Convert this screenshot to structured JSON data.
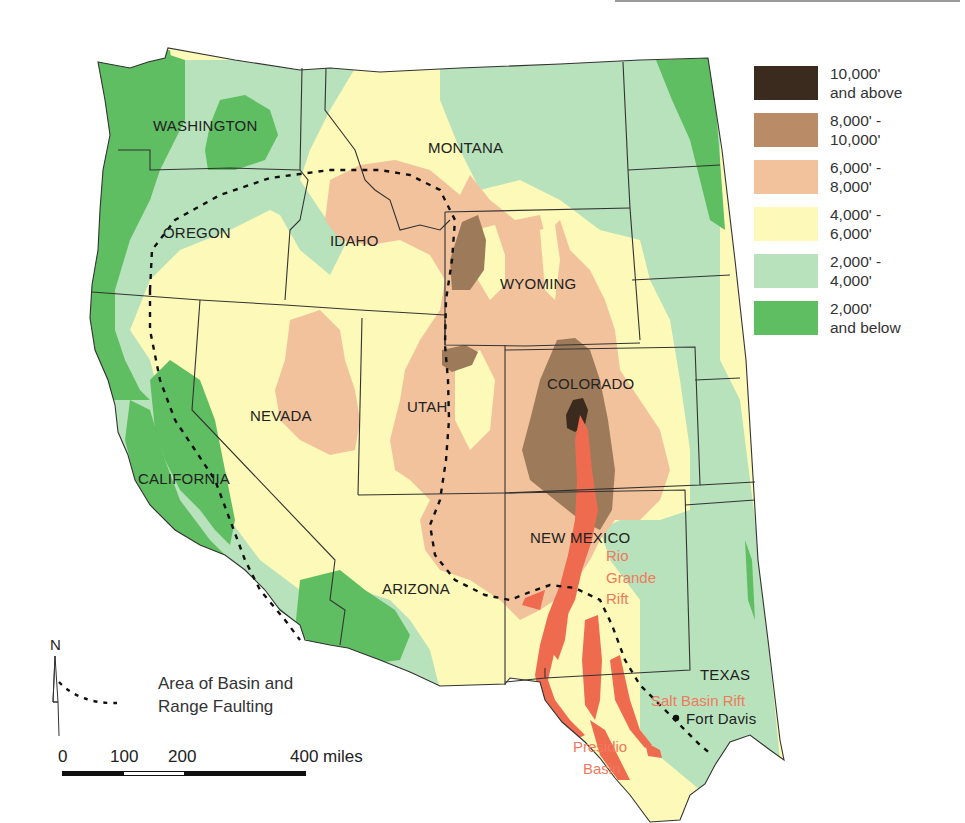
{
  "map": {
    "title": "",
    "states": [
      {
        "name": "WASHINGTON",
        "x": 153,
        "y": 131
      },
      {
        "name": "OREGON",
        "x": 163,
        "y": 238
      },
      {
        "name": "IDAHO",
        "x": 330,
        "y": 246
      },
      {
        "name": "MONTANA",
        "x": 428,
        "y": 153
      },
      {
        "name": "WYOMING",
        "x": 500,
        "y": 289
      },
      {
        "name": "NEVADA",
        "x": 250,
        "y": 421
      },
      {
        "name": "UTAH",
        "x": 407,
        "y": 412
      },
      {
        "name": "COLORADO",
        "x": 547,
        "y": 389
      },
      {
        "name": "CALIFORNIA",
        "x": 138,
        "y": 484
      },
      {
        "name": "ARIZONA",
        "x": 382,
        "y": 594
      },
      {
        "name": "NEW MEXICO",
        "x": 530,
        "y": 543
      },
      {
        "name": "TEXAS",
        "x": 700,
        "y": 680
      }
    ],
    "features": [
      {
        "name": "Rio",
        "x": 606,
        "y": 561
      },
      {
        "name": "Grande",
        "x": 606,
        "y": 583
      },
      {
        "name": "Rift",
        "x": 606,
        "y": 604
      },
      {
        "name": "Salt Basin Rift",
        "x": 651,
        "y": 706
      },
      {
        "name": "Presidio",
        "x": 573,
        "y": 752
      },
      {
        "name": "Basin",
        "x": 583,
        "y": 774
      }
    ],
    "places": [
      {
        "name": "Fort Davis",
        "x": 686,
        "y": 724
      }
    ]
  },
  "legend": {
    "elevation_classes": [
      {
        "line1": "10,000'",
        "line2": "and above",
        "color": "#3b2a1e"
      },
      {
        "line1": "8,000' -",
        "line2": "10,000'",
        "color": "#b98b66"
      },
      {
        "line1": "6,000' -",
        "line2": "8,000'",
        "color": "#f2c29c"
      },
      {
        "line1": "4,000' -",
        "line2": "6,000'",
        "color": "#fdf9b8"
      },
      {
        "line1": "2,000' -",
        "line2": "4,000'",
        "color": "#b7e2bb"
      },
      {
        "line1": "2,000'",
        "line2": "and below",
        "color": "#5fbd62"
      }
    ],
    "fault_line1": "Area of Basin and",
    "fault_line2": "Range Faulting"
  },
  "scale": {
    "labels": [
      "0",
      "100",
      "200",
      "400 miles"
    ],
    "unit": "miles"
  },
  "north_arrow": {
    "label": "N"
  },
  "colors": {
    "rift": "#ef6b50",
    "border": "#333333",
    "fault": "#111111"
  }
}
